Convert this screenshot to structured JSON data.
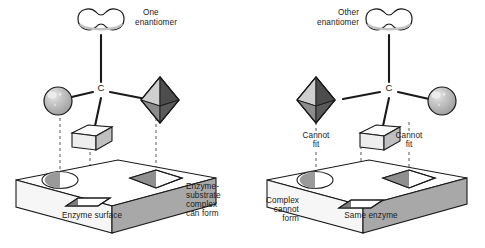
{
  "figure": {
    "type": "scientific-diagram"
  },
  "colors": {
    "stroke": "#1a1a1a",
    "sphere_fill": "#b3b3b3",
    "sphere_highlight": "#e3e3e3",
    "octahedron_light": "#c9c9c9",
    "octahedron_dark": "#555555",
    "octahedron_mid": "#8a8a8a",
    "cube_top": "#f2f2f2",
    "cube_front": "#e8e8e8",
    "cube_side": "#bdbdbd",
    "slab_top": "#ffffff",
    "slab_front": "#f4f4f4",
    "slab_side": "#a8a8a8",
    "site_shade": "#9a9a9a",
    "text": "#1a1a1a"
  },
  "panels": [
    {
      "id": "left",
      "molecule_label": "One\nenantiomer",
      "molecule_label_lines": [
        "One",
        "enantiomer"
      ],
      "center_atom": "C",
      "substituents": [
        {
          "name": "peanut-group",
          "shape": "peanut",
          "position": "top"
        },
        {
          "name": "sphere-group",
          "shape": "sphere",
          "position": "left"
        },
        {
          "name": "octahedron-group",
          "shape": "octahedron",
          "position": "right"
        },
        {
          "name": "cube-group",
          "shape": "cube",
          "position": "bottom"
        }
      ],
      "binding_sites": [
        {
          "name": "oval-site",
          "shape": "oval",
          "position": "left"
        },
        {
          "name": "diamond-site",
          "shape": "diamond",
          "position": "right"
        },
        {
          "name": "slot-site",
          "shape": "parallelogram",
          "position": "center"
        }
      ],
      "surface_label": "Enzyme surface",
      "outcome_label_lines": [
        "Enzyme-",
        "substrate",
        "complex",
        "can form"
      ],
      "fit_annotations": []
    },
    {
      "id": "right",
      "molecule_label": "Other\nenantiomer",
      "molecule_label_lines": [
        "Other",
        "enantiomer"
      ],
      "center_atom": "C",
      "substituents": [
        {
          "name": "peanut-group",
          "shape": "peanut",
          "position": "top"
        },
        {
          "name": "octahedron-group",
          "shape": "octahedron",
          "position": "left"
        },
        {
          "name": "sphere-group",
          "shape": "sphere",
          "position": "right"
        },
        {
          "name": "cube-group",
          "shape": "cube",
          "position": "bottom"
        }
      ],
      "binding_sites": [
        {
          "name": "oval-site",
          "shape": "oval",
          "position": "left"
        },
        {
          "name": "diamond-site",
          "shape": "diamond",
          "position": "right"
        },
        {
          "name": "slot-site",
          "shape": "parallelogram",
          "position": "center"
        }
      ],
      "surface_label": "Same enzyme",
      "outcome_label_lines": [
        "Complex",
        "cannot",
        "form"
      ],
      "fit_annotations": [
        {
          "name": "cannot-fit-left",
          "lines": [
            "Cannot",
            "fit"
          ]
        },
        {
          "name": "cannot-fit-right",
          "lines": [
            "Cannot",
            "fit"
          ]
        }
      ]
    }
  ],
  "text": {
    "left_molecule_l1": "One",
    "left_molecule_l2": "enantiomer",
    "right_molecule_l1": "Other",
    "right_molecule_l2": "enantiomer",
    "carbon": "C",
    "left_surface": "Enzyme surface",
    "right_surface": "Same enzyme",
    "left_outcome_l1": "Enzyme-",
    "left_outcome_l2": "substrate",
    "left_outcome_l3": "complex",
    "left_outcome_l4": "can form",
    "right_outcome_l1": "Complex",
    "right_outcome_l2": "cannot",
    "right_outcome_l3": "form",
    "cannot_l1": "Cannot",
    "cannot_l2": "fit"
  }
}
